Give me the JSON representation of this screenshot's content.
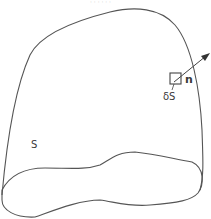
{
  "figure": {
    "caption_fragment": "· · · · · ·",
    "surface_label": "S",
    "element_label": "δS",
    "normal_label": "n",
    "colors": {
      "stroke": "#555555",
      "text": "#3a3a3a",
      "background": "#ffffff"
    }
  }
}
